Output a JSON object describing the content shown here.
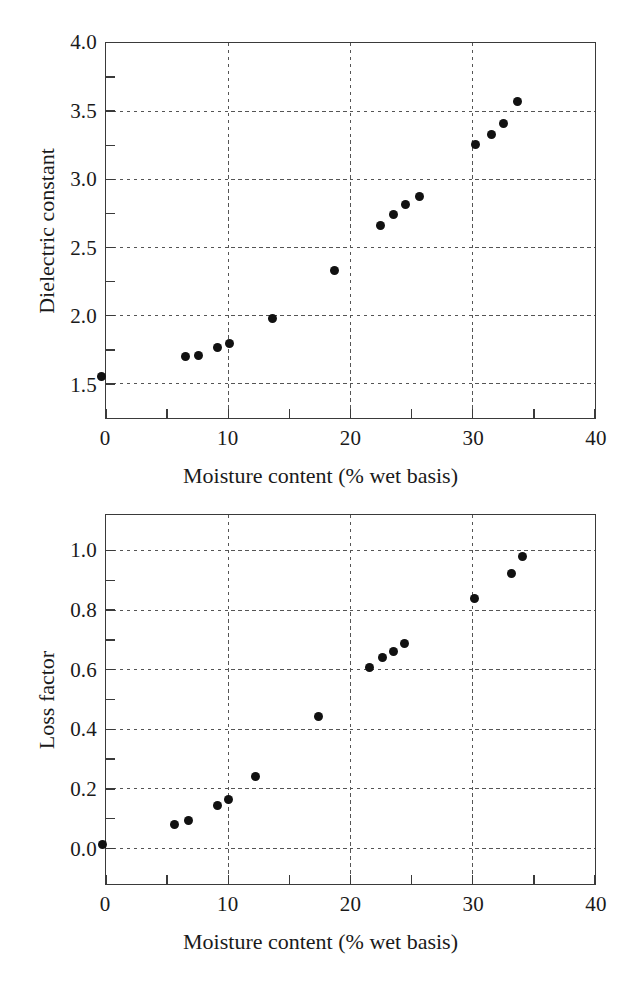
{
  "figure": {
    "background": "#ffffff",
    "marker_color": "#111111",
    "axis_color": "#3a3a3a",
    "grid_color": "#555555"
  },
  "chart_data": [
    {
      "id": "dielectric-constant",
      "type": "scatter",
      "title": "",
      "xlabel": "Moisture content (% wet basis)",
      "ylabel": "Dielectric constant",
      "xlim": [
        0,
        40
      ],
      "ylim": [
        1.25,
        4.0
      ],
      "xticks": [
        0,
        10,
        20,
        30,
        40
      ],
      "xtick_labels": [
        "0",
        "10",
        "20",
        "30",
        "40"
      ],
      "yticks": [
        1.5,
        2.0,
        2.5,
        3.0,
        3.5,
        4.0
      ],
      "ytick_labels": [
        "1.5",
        "2.0",
        "2.5",
        "3.0",
        "3.5",
        "4.0"
      ],
      "minor_yticks": [
        1.75,
        2.25,
        2.75,
        3.25,
        3.75
      ],
      "minor_xticks": [
        5,
        15,
        25,
        35
      ],
      "grid": true,
      "grid_style": "dashed",
      "legend": "none",
      "x": [
        -0.4,
        6.5,
        7.5,
        9.1,
        10.1,
        13.6,
        18.6,
        22.4,
        23.4,
        24.4,
        25.5,
        30.1,
        31.4,
        32.4,
        33.5
      ],
      "y": [
        1.57,
        1.71,
        1.72,
        1.78,
        1.81,
        1.99,
        2.34,
        2.67,
        2.75,
        2.82,
        2.88,
        3.26,
        3.33,
        3.41,
        3.57
      ]
    },
    {
      "id": "loss-factor",
      "type": "scatter",
      "title": "",
      "xlabel": "Moisture content (% wet basis)",
      "ylabel": "Loss factor",
      "xlim": [
        0,
        40
      ],
      "ylim": [
        -0.12,
        1.12
      ],
      "xticks": [
        0,
        10,
        20,
        30,
        40
      ],
      "xtick_labels": [
        "0",
        "10",
        "20",
        "30",
        "40"
      ],
      "yticks": [
        0.0,
        0.2,
        0.4,
        0.6,
        0.8,
        1.0
      ],
      "ytick_labels": [
        "0.0",
        "0.2",
        "0.4",
        "0.6",
        "0.8",
        "1.0"
      ],
      "minor_yticks": [
        0.1,
        0.3,
        0.5,
        0.7,
        0.9
      ],
      "minor_xticks": [
        5,
        15,
        25,
        35
      ],
      "grid": true,
      "grid_style": "dashed",
      "legend": "none",
      "x": [
        -0.3,
        5.6,
        6.7,
        9.1,
        10.0,
        12.2,
        17.3,
        21.5,
        22.5,
        23.4,
        24.3,
        30.0,
        33.0,
        33.9
      ],
      "y": [
        0.018,
        0.085,
        0.1,
        0.15,
        0.17,
        0.245,
        0.445,
        0.61,
        0.645,
        0.665,
        0.69,
        0.84,
        0.925,
        0.98
      ]
    }
  ]
}
